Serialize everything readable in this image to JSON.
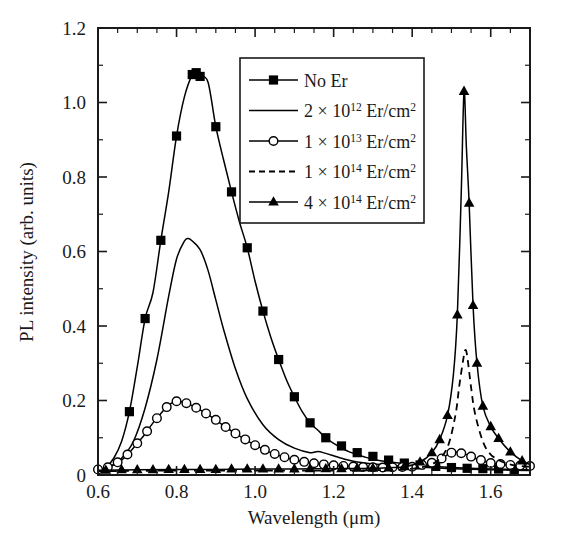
{
  "chart_data": {
    "type": "line",
    "title": "",
    "xlabel": "Wavelength (μm)",
    "ylabel": "PL intensity (arb. units)",
    "xlim": [
      0.6,
      1.7
    ],
    "ylim": [
      0,
      1.2
    ],
    "grid": false,
    "legend_position": "upper-center-right",
    "xticks": [
      0.6,
      0.8,
      1.0,
      1.2,
      1.4,
      1.6
    ],
    "xticklabels": [
      "0.6",
      "0.8",
      "1.0",
      "1.2",
      "1.4",
      "1.6"
    ],
    "xminor_step": 0.05,
    "yticks": [
      0,
      0.2,
      0.4,
      0.6,
      0.8,
      1.0,
      1.2
    ],
    "yticklabels": [
      "0",
      "0.2",
      "0.4",
      "0.6",
      "0.8",
      "1.0",
      "1.2"
    ],
    "yminor_step": 0.1,
    "series": [
      {
        "name": "No Er",
        "label_text": "No Er",
        "base": "",
        "exponent": "",
        "unit": "",
        "marker": "square",
        "linestyle": "solid",
        "x": [
          0.6,
          0.62,
          0.64,
          0.66,
          0.68,
          0.7,
          0.72,
          0.74,
          0.76,
          0.78,
          0.8,
          0.82,
          0.84,
          0.85,
          0.86,
          0.88,
          0.9,
          0.92,
          0.94,
          0.96,
          0.98,
          1.0,
          1.02,
          1.04,
          1.06,
          1.08,
          1.1,
          1.12,
          1.14,
          1.16,
          1.18,
          1.2,
          1.24,
          1.28,
          1.32,
          1.4,
          1.5,
          1.6,
          1.7
        ],
        "y": [
          0.01,
          0.02,
          0.045,
          0.09,
          0.17,
          0.29,
          0.42,
          0.49,
          0.63,
          0.76,
          0.91,
          1.015,
          1.075,
          1.08,
          1.07,
          1.055,
          0.935,
          0.845,
          0.76,
          0.68,
          0.61,
          0.52,
          0.44,
          0.37,
          0.31,
          0.255,
          0.21,
          0.17,
          0.14,
          0.12,
          0.1,
          0.085,
          0.062,
          0.048,
          0.038,
          0.028,
          0.02,
          0.016,
          0.014
        ],
        "marker_x": [
          0.68,
          0.72,
          0.76,
          0.8,
          0.84,
          0.85,
          0.86,
          0.9,
          0.94,
          0.98,
          1.02,
          1.06,
          1.1,
          1.14,
          1.18,
          1.22,
          1.26,
          1.3,
          1.34,
          1.38,
          1.42,
          1.46,
          1.5,
          1.54,
          1.58,
          1.62,
          1.66
        ],
        "marker_y": [
          0.17,
          0.42,
          0.63,
          0.91,
          1.075,
          1.08,
          1.07,
          0.935,
          0.76,
          0.61,
          0.44,
          0.31,
          0.21,
          0.14,
          0.1,
          0.078,
          0.06,
          0.05,
          0.04,
          0.032,
          0.027,
          0.023,
          0.02,
          0.018,
          0.017,
          0.016,
          0.015
        ]
      },
      {
        "name": "2e12",
        "label_text": "Er/cm",
        "base": "2 × 10",
        "exponent": "12",
        "unit": "2",
        "marker": "none",
        "linestyle": "solid",
        "peak_wavelength": 0.83,
        "peak_value": 0.635,
        "x": [
          0.6,
          0.63,
          0.66,
          0.69,
          0.72,
          0.75,
          0.78,
          0.8,
          0.82,
          0.83,
          0.84,
          0.86,
          0.88,
          0.9,
          0.92,
          0.95,
          0.98,
          1.02,
          1.06,
          1.1,
          1.14,
          1.16,
          1.18,
          1.22,
          1.26,
          1.32,
          1.4,
          1.5,
          1.6,
          1.7
        ],
        "y": [
          0.012,
          0.022,
          0.045,
          0.09,
          0.18,
          0.31,
          0.48,
          0.58,
          0.628,
          0.635,
          0.628,
          0.605,
          0.55,
          0.47,
          0.39,
          0.285,
          0.205,
          0.135,
          0.095,
          0.072,
          0.06,
          0.063,
          0.058,
          0.045,
          0.035,
          0.028,
          0.022,
          0.017,
          0.014,
          0.012
        ]
      },
      {
        "name": "1e13",
        "label_text": "Er/cm",
        "base": "1 × 10",
        "exponent": "13",
        "unit": "2",
        "marker": "circle",
        "linestyle": "solid",
        "peak_wavelength": 0.8,
        "peak_value": 0.198,
        "x": [
          0.6,
          0.63,
          0.66,
          0.68,
          0.7,
          0.72,
          0.74,
          0.76,
          0.78,
          0.8,
          0.82,
          0.84,
          0.86,
          0.88,
          0.9,
          0.93,
          0.96,
          1.0,
          1.04,
          1.08,
          1.12,
          1.16,
          1.2,
          1.26,
          1.32,
          1.4,
          1.46,
          1.5,
          1.53,
          1.56,
          1.6,
          1.66,
          1.7
        ],
        "y": [
          0.015,
          0.022,
          0.04,
          0.06,
          0.085,
          0.11,
          0.14,
          0.165,
          0.188,
          0.198,
          0.195,
          0.186,
          0.175,
          0.162,
          0.148,
          0.125,
          0.105,
          0.08,
          0.06,
          0.046,
          0.036,
          0.03,
          0.026,
          0.022,
          0.02,
          0.022,
          0.035,
          0.06,
          0.058,
          0.045,
          0.032,
          0.026,
          0.024
        ],
        "marker_step": 0.025
      },
      {
        "name": "1e14",
        "label_text": "Er/cm",
        "base": "1 × 10",
        "exponent": "14",
        "unit": "2",
        "marker": "none",
        "linestyle": "dashed",
        "peak_wavelength": 1.535,
        "peak_value": 0.335,
        "x": [
          0.6,
          0.8,
          1.0,
          1.2,
          1.35,
          1.42,
          1.46,
          1.49,
          1.51,
          1.52,
          1.53,
          1.535,
          1.54,
          1.55,
          1.56,
          1.58,
          1.6,
          1.63,
          1.66,
          1.7
        ],
        "y": [
          0.01,
          0.012,
          0.012,
          0.012,
          0.014,
          0.02,
          0.035,
          0.075,
          0.16,
          0.24,
          0.31,
          0.335,
          0.32,
          0.235,
          0.165,
          0.09,
          0.055,
          0.035,
          0.026,
          0.022
        ]
      },
      {
        "name": "4e14",
        "label_text": "Er/cm",
        "base": "4 × 10",
        "exponent": "14",
        "unit": "2",
        "marker": "triangle",
        "linestyle": "solid",
        "peak_wavelength": 1.532,
        "peak_value": 1.03,
        "x": [
          0.6,
          0.7,
          0.8,
          0.9,
          1.0,
          1.1,
          1.2,
          1.3,
          1.38,
          1.42,
          1.45,
          1.47,
          1.49,
          1.505,
          1.515,
          1.525,
          1.532,
          1.538,
          1.545,
          1.555,
          1.565,
          1.58,
          1.6,
          1.62,
          1.65,
          1.68,
          1.7
        ],
        "y": [
          0.013,
          0.014,
          0.015,
          0.015,
          0.016,
          0.016,
          0.017,
          0.018,
          0.022,
          0.035,
          0.06,
          0.095,
          0.16,
          0.27,
          0.43,
          0.76,
          1.03,
          0.88,
          0.73,
          0.455,
          0.3,
          0.185,
          0.13,
          0.098,
          0.062,
          0.038,
          0.028
        ],
        "marker_x": [
          0.62,
          0.66,
          0.7,
          0.74,
          0.78,
          0.82,
          0.86,
          0.9,
          0.94,
          0.98,
          1.02,
          1.06,
          1.1,
          1.14,
          1.18,
          1.22,
          1.26,
          1.3,
          1.34,
          1.38,
          1.42,
          1.45,
          1.47,
          1.49,
          1.515,
          1.532,
          1.545,
          1.555,
          1.565,
          1.58,
          1.6,
          1.62,
          1.65,
          1.68
        ],
        "marker_y": [
          0.013,
          0.014,
          0.014,
          0.014,
          0.015,
          0.015,
          0.015,
          0.015,
          0.016,
          0.016,
          0.016,
          0.016,
          0.016,
          0.017,
          0.017,
          0.017,
          0.018,
          0.018,
          0.019,
          0.022,
          0.035,
          0.06,
          0.095,
          0.16,
          0.43,
          1.03,
          0.73,
          0.455,
          0.3,
          0.185,
          0.13,
          0.098,
          0.062,
          0.038
        ]
      }
    ]
  },
  "legend": {
    "entries": [
      {
        "label": "No Er",
        "base": "",
        "exponent": "",
        "unit": ""
      },
      {
        "label": "Er/cm",
        "base": "2 × 10",
        "exponent": "12",
        "unit": "2"
      },
      {
        "label": "Er/cm",
        "base": "1 × 10",
        "exponent": "13",
        "unit": "2"
      },
      {
        "label": "Er/cm",
        "base": "1 × 10",
        "exponent": "14",
        "unit": "2"
      },
      {
        "label": "Er/cm",
        "base": "4 × 10",
        "exponent": "14",
        "unit": "2"
      }
    ]
  },
  "colors": {
    "ink": "#1a1a1a",
    "curve": "#000000",
    "background": "#ffffff"
  }
}
